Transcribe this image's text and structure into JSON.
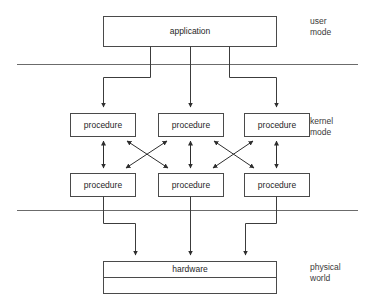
{
  "diagram": {
    "colors": {
      "background": "#ffffff",
      "box_stroke": "#4a4a4a",
      "divider_stroke": "#6b6b6b",
      "connector_stroke": "#3c3c3c",
      "text": "#1f1f1f"
    },
    "boxes": {
      "application": {
        "label": "application"
      },
      "hardware": {
        "label": "hardware"
      },
      "procedures_row1": [
        {
          "label": "procedure"
        },
        {
          "label": "procedure"
        },
        {
          "label": "procedure"
        }
      ],
      "procedures_row2": [
        {
          "label": "procedure"
        },
        {
          "label": "procedure"
        },
        {
          "label": "procedure"
        }
      ]
    },
    "zones": [
      {
        "id": "user",
        "line1": "user",
        "line2": "mode"
      },
      {
        "id": "kernel",
        "line1": "kernel",
        "line2": "mode"
      },
      {
        "id": "physical",
        "line1": "physical",
        "line2": "world"
      }
    ]
  }
}
